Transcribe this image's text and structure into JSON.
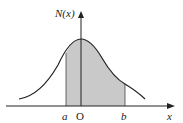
{
  "diagram": {
    "type": "normal-distribution-curve",
    "y_axis_label": "N(x)",
    "x_axis_label": "x",
    "origin_label": "O",
    "lower_bound_label": "a",
    "upper_bound_label": "b",
    "shaded_region": "area under N(x) between a and b",
    "colors": {
      "stroke": "#222222",
      "fill": "#c9c9c9",
      "background": "#ffffff"
    }
  }
}
